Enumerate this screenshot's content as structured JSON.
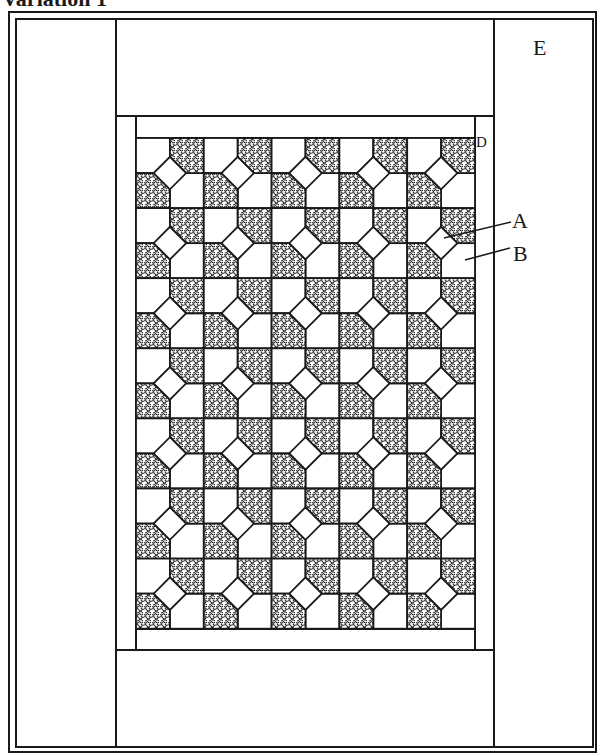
{
  "figure": {
    "title": "Variation 1",
    "labels": {
      "E": "E",
      "D": "D",
      "A": "A",
      "B": "B"
    },
    "colors": {
      "line": "#1a1a1a",
      "background": "#ffffff",
      "print_dark": "#3a3a3a",
      "print_light": "#ffffff"
    },
    "layout": {
      "outer_frame": {
        "x1": 9,
        "y1": 12,
        "x2": 596,
        "y2": 752
      },
      "inner_frame": {
        "x1": 16,
        "y1": 19,
        "x2": 593,
        "y2": 747
      },
      "side_lines_x": [
        116,
        494
      ],
      "top_band_bottom_y": 116,
      "bottom_band_top_y": 650,
      "inner_border": {
        "x1": 116,
        "y1": 116,
        "x2": 494,
        "y2": 650
      },
      "strip_lines": {
        "left_x": 136,
        "right_x": 475,
        "top_y": 138,
        "bottom_y": 629
      },
      "grid": {
        "x": 136,
        "y": 138,
        "cols": 5,
        "rows": 7,
        "block_w": 67.8,
        "block_h": 70.1
      }
    },
    "leaders": [
      {
        "label": "A",
        "x1": 444,
        "y1": 238,
        "x2": 511,
        "y2": 222
      },
      {
        "label": "B",
        "x1": 465,
        "y1": 260,
        "x2": 510,
        "y2": 248
      }
    ]
  }
}
